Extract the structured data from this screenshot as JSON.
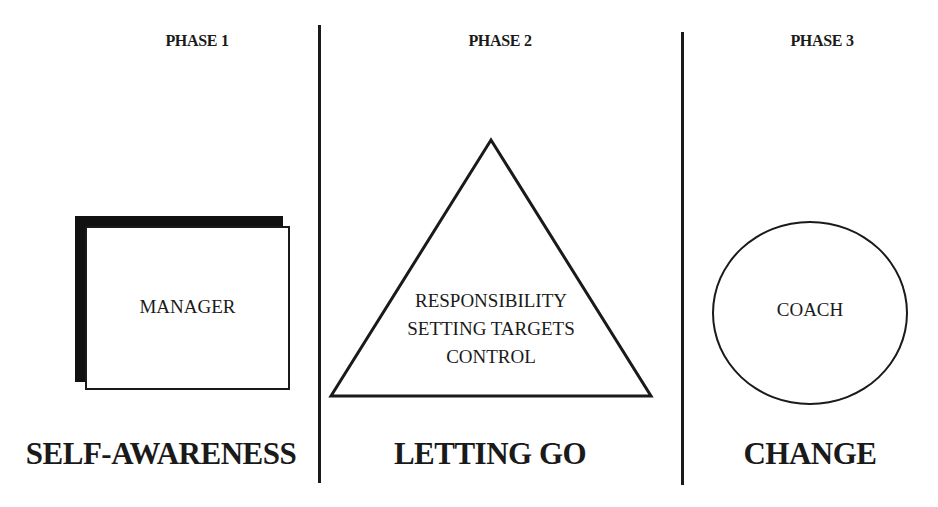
{
  "diagram": {
    "phases": [
      {
        "title": "PHASE 1",
        "shape": "rectangle-with-shadow",
        "shape_labels": [
          "MANAGER"
        ],
        "outcome": "SELF-AWARENESS"
      },
      {
        "title": "PHASE 2",
        "shape": "triangle",
        "shape_labels": [
          "RESPONSIBILITY",
          "SETTING TARGETS",
          "CONTROL"
        ],
        "outcome": "LETTING GO"
      },
      {
        "title": "PHASE 3",
        "shape": "circle",
        "shape_labels": [
          "COACH"
        ],
        "outcome": "CHANGE"
      }
    ],
    "colors": {
      "line": "#1a1a1a",
      "background": "#ffffff"
    }
  }
}
